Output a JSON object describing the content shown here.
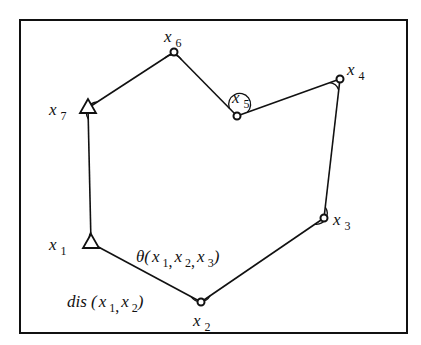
{
  "figure": {
    "frame": {
      "x": 20,
      "y": 20,
      "width": 387,
      "height": 313
    },
    "stroke_color": "#111111",
    "background": "#ffffff"
  },
  "vertices": [
    {
      "id": "x1",
      "name": "x",
      "sub": "1",
      "marker": "triangle",
      "pos": [
        91,
        243
      ],
      "label_pos": [
        49,
        250
      ]
    },
    {
      "id": "x2",
      "name": "x",
      "sub": "2",
      "marker": "circle",
      "pos": [
        201,
        302
      ],
      "label_pos": [
        193,
        326
      ]
    },
    {
      "id": "x3",
      "name": "x",
      "sub": "3",
      "marker": "circle",
      "pos": [
        324,
        218
      ],
      "label_pos": [
        333,
        225
      ]
    },
    {
      "id": "x4",
      "name": "x",
      "sub": "4",
      "marker": "circle",
      "pos": [
        340,
        79
      ],
      "label_pos": [
        347,
        75
      ]
    },
    {
      "id": "x5",
      "name": "x",
      "sub": "5",
      "marker": "circle",
      "pos": [
        237,
        116
      ],
      "label_pos": [
        232,
        103
      ]
    },
    {
      "id": "x6",
      "name": "x",
      "sub": "6",
      "marker": "circle",
      "pos": [
        174,
        52
      ],
      "label_pos": [
        164,
        42
      ]
    },
    {
      "id": "x7",
      "name": "x",
      "sub": "7",
      "marker": "triangle",
      "pos": [
        88,
        108
      ],
      "label_pos": [
        49,
        115
      ]
    }
  ],
  "annotations": {
    "theta": {
      "prefix": "θ(",
      "parts": [
        [
          "x",
          "1"
        ],
        [
          "x",
          "2"
        ],
        [
          "x",
          "3"
        ]
      ],
      "suffix": ")",
      "pos": [
        136,
        262
      ]
    },
    "dis": {
      "prefix": "dis",
      "open": " (",
      "parts": [
        [
          "x",
          "1"
        ],
        [
          "x",
          "2"
        ]
      ],
      "suffix": ")",
      "pos": [
        67,
        307
      ]
    }
  },
  "text": {
    "theta_label": "θ(x1, x2, x3)",
    "dis_label": "dis (x1, x2)",
    "vertex_labels": [
      "x1",
      "x2",
      "x3",
      "x4",
      "x5",
      "x6",
      "x7"
    ]
  }
}
